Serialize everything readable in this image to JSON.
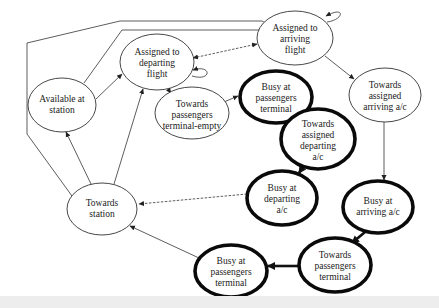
{
  "diagram": {
    "title": "",
    "nodes": [
      {
        "id": "available",
        "lines": [
          "Available at",
          "station"
        ],
        "style": "thin",
        "cx": 62,
        "cy": 105,
        "rx": 34,
        "ry": 27
      },
      {
        "id": "assigned_dep",
        "lines": [
          "Assigned to",
          "departing",
          "flight"
        ],
        "style": "thin",
        "cx": 157,
        "cy": 62,
        "rx": 37,
        "ry": 28
      },
      {
        "id": "assigned_arr",
        "lines": [
          "Assigned to",
          "arriving",
          "flight"
        ],
        "style": "thin",
        "cx": 295,
        "cy": 38,
        "rx": 38,
        "ry": 27
      },
      {
        "id": "tpt_empty",
        "lines": [
          "Towards",
          "passengers",
          "terminal-empty"
        ],
        "style": "thin",
        "cx": 192,
        "cy": 113,
        "rx": 37,
        "ry": 26
      },
      {
        "id": "busy_pt_top",
        "lines": [
          "Busy at",
          "passengers",
          "terminal"
        ],
        "style": "thick",
        "cx": 276,
        "cy": 97,
        "rx": 36,
        "ry": 26
      },
      {
        "id": "toward_dep_ac",
        "lines": [
          "Towards",
          "assigned",
          "departing",
          "a/c"
        ],
        "style": "thick",
        "cx": 318,
        "cy": 139,
        "rx": 37,
        "ry": 30
      },
      {
        "id": "toward_arr_ac",
        "lines": [
          "Towards",
          "assigned",
          "arriving a/c"
        ],
        "style": "thin",
        "cx": 385,
        "cy": 95,
        "rx": 36,
        "ry": 27
      },
      {
        "id": "busy_dep_ac",
        "lines": [
          "Busy at",
          "departing",
          "a/c"
        ],
        "style": "thick",
        "cx": 282,
        "cy": 198,
        "rx": 35,
        "ry": 27
      },
      {
        "id": "towards_station",
        "lines": [
          "Towards",
          "station"
        ],
        "style": "thin",
        "cx": 102,
        "cy": 209,
        "rx": 35,
        "ry": 26
      },
      {
        "id": "busy_arr_ac",
        "lines": [
          "Busy at",
          "arriving a/c"
        ],
        "style": "thick",
        "cx": 378,
        "cy": 207,
        "rx": 35,
        "ry": 26
      },
      {
        "id": "busy_pt_bottom",
        "lines": [
          "Busy at",
          "passengers",
          "terminal"
        ],
        "style": "thick",
        "cx": 231,
        "cy": 271,
        "rx": 36,
        "ry": 26
      },
      {
        "id": "tpt",
        "lines": [
          "Towards",
          "passengers",
          "terminal"
        ],
        "style": "thick",
        "cx": 335,
        "cy": 265,
        "rx": 36,
        "ry": 27
      }
    ],
    "edges": [
      {
        "from": "available",
        "to": "assigned_dep",
        "style": "solid"
      },
      {
        "from": "available",
        "to": "assigned_arr",
        "style": "solid",
        "route": "top-outer"
      },
      {
        "from": "towards_station",
        "to": "assigned_arr",
        "style": "solid",
        "route": "left-outer"
      },
      {
        "from": "assigned_arr",
        "to": "assigned_dep",
        "style": "dashed",
        "bidirectional": true
      },
      {
        "from": "assigned_dep",
        "to": "assigned_dep",
        "style": "solid",
        "self_loop": true
      },
      {
        "from": "assigned_arr",
        "to": "assigned_arr",
        "style": "solid",
        "self_loop": true
      },
      {
        "from": "assigned_dep",
        "to": "tpt_empty",
        "style": "solid"
      },
      {
        "from": "tpt_empty",
        "to": "busy_pt_top",
        "style": "solid"
      },
      {
        "from": "busy_pt_top",
        "to": "toward_dep_ac",
        "style": "thick"
      },
      {
        "from": "toward_dep_ac",
        "to": "busy_dep_ac",
        "style": "thick"
      },
      {
        "from": "busy_dep_ac",
        "to": "towards_station",
        "style": "dashed"
      },
      {
        "from": "towards_station",
        "to": "available",
        "style": "solid"
      },
      {
        "from": "towards_station",
        "to": "assigned_dep",
        "style": "solid"
      },
      {
        "from": "assigned_arr",
        "to": "toward_arr_ac",
        "style": "solid"
      },
      {
        "from": "toward_arr_ac",
        "to": "busy_arr_ac",
        "style": "solid"
      },
      {
        "from": "busy_arr_ac",
        "to": "tpt",
        "style": "thick"
      },
      {
        "from": "tpt",
        "to": "busy_pt_bottom",
        "style": "thick"
      },
      {
        "from": "busy_pt_bottom",
        "to": "towards_station",
        "style": "solid"
      }
    ]
  },
  "labels": {
    "available": [
      "Available at",
      "station"
    ],
    "assigned_dep": [
      "Assigned to",
      "departing",
      "flight"
    ],
    "assigned_arr": [
      "Assigned to",
      "arriving",
      "flight"
    ],
    "tpt_empty": [
      "Towards",
      "passengers",
      "terminal-empty"
    ],
    "busy_pt_top": [
      "Busy at",
      "passengers",
      "terminal"
    ],
    "toward_dep_ac": [
      "Towards",
      "assigned",
      "departing",
      "a/c"
    ],
    "toward_arr_ac": [
      "Towards",
      "assigned",
      "arriving a/c"
    ],
    "busy_dep_ac": [
      "Busy at",
      "departing",
      "a/c"
    ],
    "towards_station": [
      "Towards",
      "station"
    ],
    "busy_arr_ac": [
      "Busy at",
      "arriving a/c"
    ],
    "busy_pt_bottom": [
      "Busy at",
      "passengers",
      "terminal"
    ],
    "tpt": [
      "Towards",
      "passengers",
      "terminal"
    ]
  }
}
